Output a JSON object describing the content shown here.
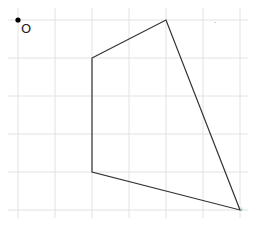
{
  "canvas": {
    "width": 261,
    "height": 226,
    "background": "#ffffff",
    "grid_color": "#e2e2e2",
    "line_color": "#333333"
  },
  "grid": {
    "vertical_x": [
      18,
      55,
      92,
      129,
      166,
      203,
      240
    ],
    "horizontal_y": [
      20,
      58,
      96,
      134,
      172,
      210
    ]
  },
  "origin": {
    "label": "O",
    "x": 18,
    "y": 20
  },
  "polygon": {
    "vertices": [
      [
        92,
        58
      ],
      [
        166,
        20
      ],
      [
        240,
        210
      ],
      [
        92,
        172
      ]
    ]
  },
  "marks": [
    {
      "x": 214,
      "y": 24,
      "text": "-"
    },
    {
      "x": 241,
      "y": 211,
      "text": "i"
    }
  ]
}
